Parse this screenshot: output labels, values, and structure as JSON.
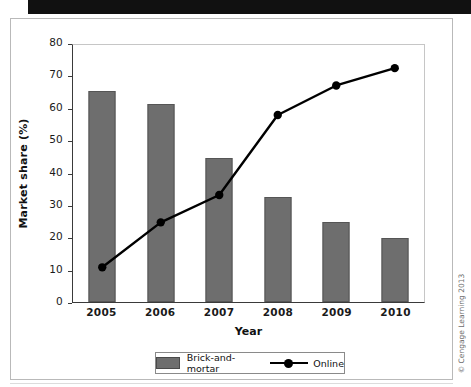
{
  "figure": {
    "credit": "© Cengage Learning 2013"
  },
  "legend": {
    "bar_label": "Brick-and-mortar",
    "line_label": "Online"
  },
  "colors": {
    "bar_fill": "#6e6e6e",
    "bar_stroke": "#555555",
    "line": "#000000",
    "axis": "#3a3a3a",
    "frame": "#b9b9b9"
  },
  "chart_data": {
    "type": "bar",
    "title": "",
    "xlabel": "Year",
    "ylabel": "Market share (%)",
    "categories": [
      "2005",
      "2006",
      "2007",
      "2008",
      "2009",
      "2010"
    ],
    "ylim": [
      0,
      80
    ],
    "ytick_labels": [
      "0",
      "10",
      "20",
      "30",
      "40",
      "50",
      "60",
      "70",
      "80"
    ],
    "ytick_values": [
      0,
      10,
      20,
      30,
      40,
      50,
      60,
      70,
      80
    ],
    "ystep": 10,
    "grid": false,
    "legend_position": "bottom",
    "series": [
      {
        "name": "Brick-and-mortar",
        "type": "bar",
        "values": [
          65.2,
          61.2,
          44.5,
          32.4,
          24.8,
          19.7
        ]
      },
      {
        "name": "Online",
        "type": "line",
        "marker": "circle",
        "values": [
          10.8,
          24.8,
          33.3,
          58.2,
          67.4,
          72.8
        ]
      }
    ]
  }
}
